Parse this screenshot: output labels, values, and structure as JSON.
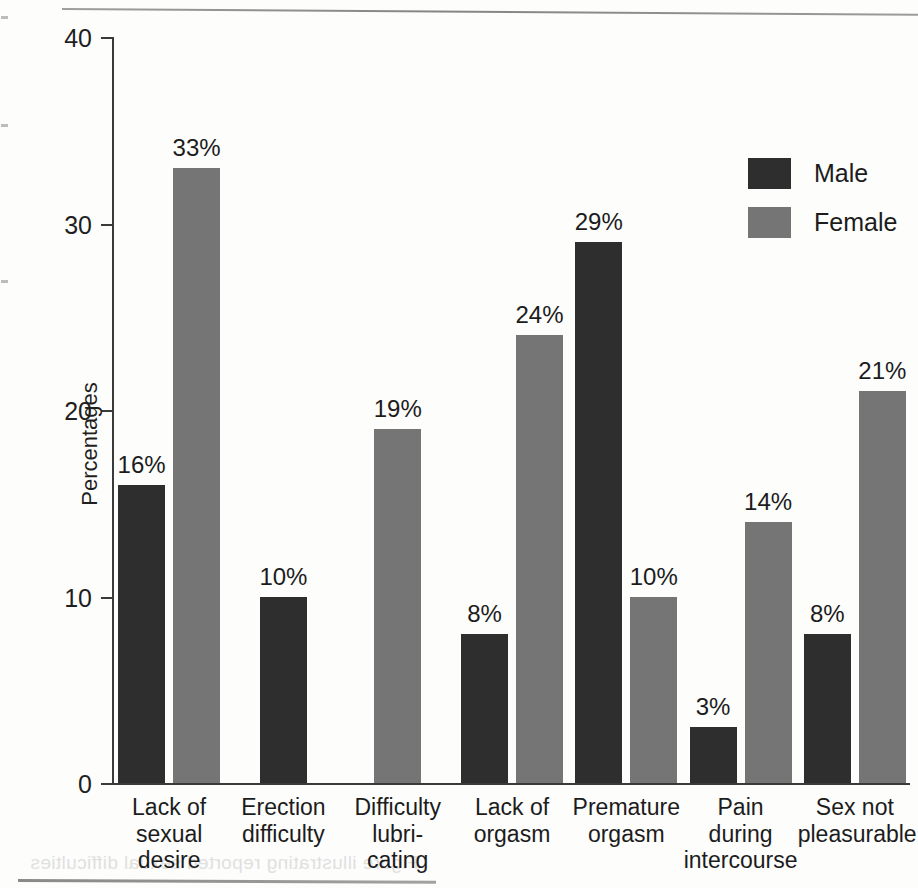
{
  "chart_data": {
    "type": "bar",
    "title": "",
    "subtitle": "",
    "xlabel": "",
    "ylabel": "Percentages",
    "ylim": [
      0,
      40
    ],
    "yticks": [
      0,
      10,
      20,
      30,
      40
    ],
    "ytick_labels": [
      "0",
      "10",
      "20",
      "30",
      "40"
    ],
    "grid": false,
    "legend_position": "top-right",
    "value_suffix": "%",
    "categories": [
      "Lack of sexual desire",
      "Erection difficulty",
      "Difficulty lubricating",
      "Lack of orgasm",
      "Premature orgasm",
      "Pain during intercourse",
      "Sex not pleasurable"
    ],
    "category_lines": [
      [
        "Lack of",
        "sexual",
        "desire"
      ],
      [
        "Erection",
        "difficulty"
      ],
      [
        "Difficulty",
        "lubri-",
        "cating"
      ],
      [
        "Lack of",
        "orgasm"
      ],
      [
        "Premature",
        "orgasm"
      ],
      [
        "Pain during",
        "intercourse"
      ],
      [
        "Sex not",
        "pleasurable"
      ]
    ],
    "series": [
      {
        "name": "Male",
        "color": "#2e2e2e",
        "values": [
          16,
          10,
          null,
          8,
          29,
          3,
          8
        ],
        "labels": [
          "16%",
          "10%",
          null,
          "8%",
          "29%",
          "3%",
          "8%"
        ]
      },
      {
        "name": "Female",
        "color": "#757575",
        "values": [
          33,
          null,
          19,
          24,
          10,
          14,
          21
        ],
        "labels": [
          "33%",
          null,
          "19%",
          "24%",
          "10%",
          "14%",
          "21%"
        ]
      }
    ]
  },
  "legend": {
    "entries": [
      {
        "label": "Male",
        "color": "#2e2e2e"
      },
      {
        "label": "Female",
        "color": "#757575"
      }
    ]
  },
  "artifacts": {
    "bleed_text_bottom": "Figure illustrating reported sexual difficulties"
  }
}
